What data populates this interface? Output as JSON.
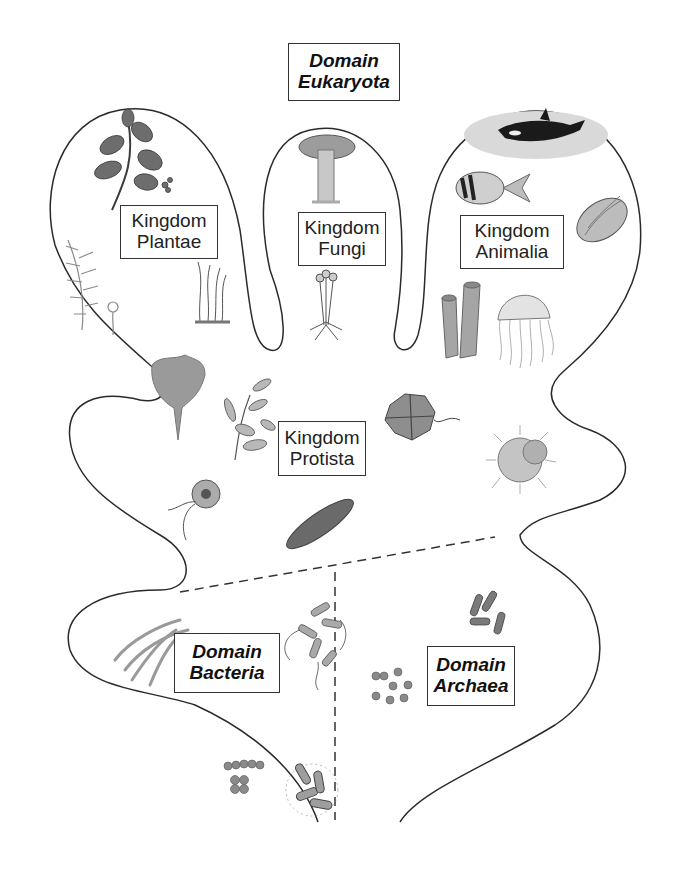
{
  "diagram": {
    "title_box": {
      "line1": "Domain",
      "line2": "Eukaryota"
    },
    "kingdoms": [
      {
        "id": "plantae",
        "line1": "Kingdom",
        "line2": "Plantae",
        "organisms": [
          "leafy-branch",
          "fern-frond",
          "moss"
        ]
      },
      {
        "id": "fungi",
        "line1": "Kingdom",
        "line2": "Fungi",
        "organisms": [
          "mushroom",
          "bread-mold"
        ]
      },
      {
        "id": "animalia",
        "line1": "Kingdom",
        "line2": "Animalia",
        "organisms": [
          "orca",
          "tropical-fish",
          "clam",
          "tube-sponge",
          "jellyfish"
        ]
      },
      {
        "id": "protista",
        "line1": "Kingdom",
        "line2": "Protista",
        "organisms": [
          "red-alga",
          "brown-alga",
          "dinoflagellate",
          "radiolarian",
          "flagellate",
          "paramecium"
        ]
      }
    ],
    "domains": [
      {
        "id": "bacteria",
        "line1": "Domain",
        "line2": "Bacteria",
        "organisms": [
          "filamentous-bacteria",
          "flagellated-rods",
          "cocci-chain",
          "cocci-cluster",
          "piliated-rods"
        ]
      },
      {
        "id": "archaea",
        "line1": "Domain",
        "line2": "Archaea",
        "organisms": [
          "cocci",
          "rods"
        ]
      }
    ],
    "colors": {
      "outline": "#2a2a2a",
      "dashed": "#333333",
      "organism_gray": "#8a8a8a",
      "orca_bg": "#d9d9d9"
    }
  }
}
